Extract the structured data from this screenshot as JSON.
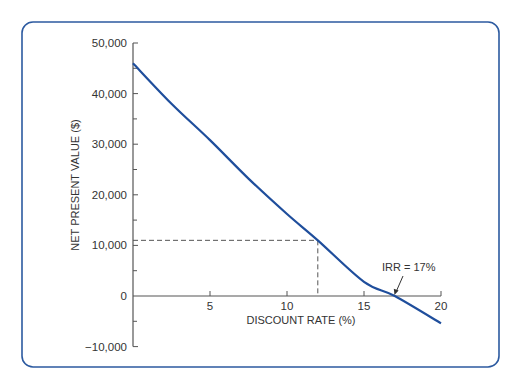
{
  "chart_data": {
    "type": "line",
    "title": "",
    "xlabel": "DISCOUNT RATE (%)",
    "ylabel": "NET PRESENT VALUE ($)",
    "xlim": [
      0,
      20
    ],
    "ylim": [
      -10000,
      50000
    ],
    "x_ticks": [
      5,
      10,
      15,
      20
    ],
    "x_tick_labels": [
      "5",
      "10",
      "15",
      "20"
    ],
    "y_ticks": [
      -10000,
      0,
      10000,
      20000,
      30000,
      40000,
      50000
    ],
    "y_tick_labels": [
      "−10,000",
      "0",
      "10,000",
      "20,000",
      "30,000",
      "40,000",
      "50,000"
    ],
    "y_minor_ticks": [
      -5000,
      5000,
      15000,
      25000,
      35000,
      45000
    ],
    "grid": false,
    "series": [
      {
        "name": "NPV",
        "color": "#1f4e9c",
        "x": [
          0,
          2.5,
          5,
          7.5,
          10,
          12,
          15,
          17,
          20
        ],
        "values": [
          46000,
          38000,
          30800,
          23200,
          16200,
          11000,
          2800,
          0,
          -5400
        ]
      }
    ],
    "reference_point": {
      "x": 12,
      "y": 11000,
      "style": "dashed"
    },
    "annotations": [
      {
        "text": "IRR = 17%",
        "x": 17,
        "y": 0,
        "arrow": true
      }
    ]
  },
  "labels": {
    "xlabel": "DISCOUNT RATE (%)",
    "ylabel": "NET PRESENT VALUE ($)",
    "irr": "IRR = 17%"
  },
  "colors": {
    "frame": "#2c5aa0",
    "curve": "#1f4e9c",
    "axis": "#555555"
  }
}
